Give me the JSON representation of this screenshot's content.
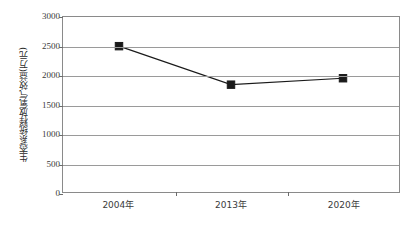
{
  "chart_data": {
    "type": "line",
    "title": "",
    "xlabel": "",
    "ylabel": "生态系统释放氧气效益(万元)",
    "categories": [
      "2004年",
      "2013年",
      "2020年"
    ],
    "values": [
      2500,
      1840,
      1950
    ],
    "series": [
      {
        "name": "生态系统释放氧气效益",
        "values": [
          2500,
          1840,
          1950
        ]
      }
    ],
    "ylim": [
      0,
      3000
    ],
    "y_ticks": [
      0,
      500,
      1000,
      1500,
      2000,
      2500,
      3000
    ],
    "y_tick_labels": [
      "0",
      "500",
      "1000",
      "1500",
      "2000",
      "2500",
      "3000"
    ],
    "grid": true,
    "legend": "none",
    "marker": "square",
    "marker_color": "#1a1a1a",
    "line_color": "#1a1a1a",
    "axis_color": "#8a8a8a",
    "background": "#ffffff"
  }
}
